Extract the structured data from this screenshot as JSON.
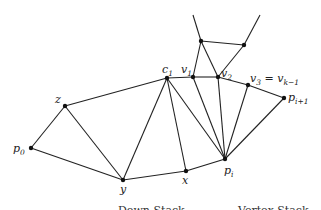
{
  "diagram": {
    "type": "triangulation",
    "nodes": [
      {
        "id": "p0",
        "label": "p",
        "sub": "0",
        "x": 31,
        "y": 148,
        "lx": 13,
        "ly": 152
      },
      {
        "id": "z",
        "label": "z",
        "sub": "",
        "x": 65,
        "y": 106,
        "lx": 55,
        "ly": 103
      },
      {
        "id": "y",
        "label": "y",
        "sub": "",
        "x": 123,
        "y": 180,
        "lx": 120,
        "ly": 193
      },
      {
        "id": "x",
        "label": "x",
        "sub": "",
        "x": 186,
        "y": 171,
        "lx": 182,
        "ly": 184
      },
      {
        "id": "c1",
        "label": "c",
        "sub": "1",
        "x": 167,
        "y": 78,
        "lx": 162,
        "ly": 73
      },
      {
        "id": "v1",
        "label": "v",
        "sub": "1",
        "x": 193,
        "y": 77,
        "lx": 181,
        "ly": 73
      },
      {
        "id": "v2",
        "label": "v",
        "sub": "2",
        "x": 218,
        "y": 77,
        "lx": 221,
        "ly": 77
      },
      {
        "id": "v3",
        "label": "v",
        "sub": "3",
        "x": 248,
        "y": 85,
        "lx": 250,
        "ly": 82
      },
      {
        "id": "pi1",
        "label": "p",
        "sub": "i+1",
        "x": 284,
        "y": 98,
        "lx": 288,
        "ly": 101
      },
      {
        "id": "pi",
        "label": "p",
        "sub": "i",
        "x": 225,
        "y": 159,
        "lx": 224,
        "ly": 174
      },
      {
        "id": "t1",
        "label": "",
        "sub": "",
        "x": 201,
        "y": 41
      },
      {
        "id": "t2",
        "label": "",
        "sub": "",
        "x": 244,
        "y": 45
      }
    ],
    "v3_suffix": " = v",
    "v3_suffix_sub": "k−1",
    "edges": [
      [
        "p0",
        "z"
      ],
      [
        "p0",
        "y"
      ],
      [
        "z",
        "y"
      ],
      [
        "z",
        "c1"
      ],
      [
        "y",
        "c1"
      ],
      [
        "y",
        "x"
      ],
      [
        "x",
        "c1"
      ],
      [
        "x",
        "pi"
      ],
      [
        "c1",
        "pi"
      ],
      [
        "c1",
        "v1"
      ],
      [
        "v1",
        "v2"
      ],
      [
        "v1",
        "pi"
      ],
      [
        "v2",
        "pi"
      ],
      [
        "v2",
        "v3"
      ],
      [
        "v3",
        "pi"
      ],
      [
        "v3",
        "pi1"
      ],
      [
        "pi1",
        "pi"
      ],
      [
        "t1",
        "v1"
      ],
      [
        "t1",
        "v2"
      ],
      [
        "t1",
        "t2"
      ],
      [
        "t2",
        "v2"
      ]
    ],
    "open_edges": [
      {
        "x1": 193,
        "y1": 15,
        "x2": 201,
        "y2": 41
      },
      {
        "x1": 260,
        "y1": 15,
        "x2": 244,
        "y2": 45
      }
    ],
    "captions": [
      {
        "text": "Down Stack",
        "x": 118,
        "y": 214
      },
      {
        "text": "Vertex Stack",
        "x": 238,
        "y": 214
      }
    ]
  }
}
